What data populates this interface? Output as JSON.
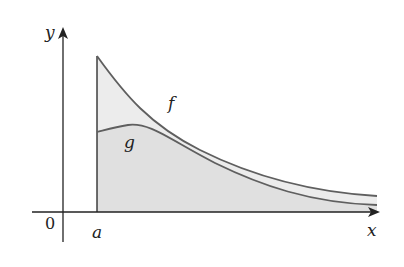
{
  "diagram": {
    "axes": {
      "x_label": "x",
      "y_label": "y",
      "origin_label": "0"
    },
    "markers": {
      "a_label": "a"
    },
    "curves": [
      {
        "name": "f",
        "label": "f",
        "role": "upper curve, decreasing from x=a"
      },
      {
        "name": "g",
        "label": "g",
        "role": "lower curve, rises slightly then decreases"
      }
    ],
    "colors": {
      "axis": "#222222",
      "curve": "#5f5f5f",
      "fill_between": "#ececec",
      "fill_under_g": "#e0e0e0"
    }
  }
}
